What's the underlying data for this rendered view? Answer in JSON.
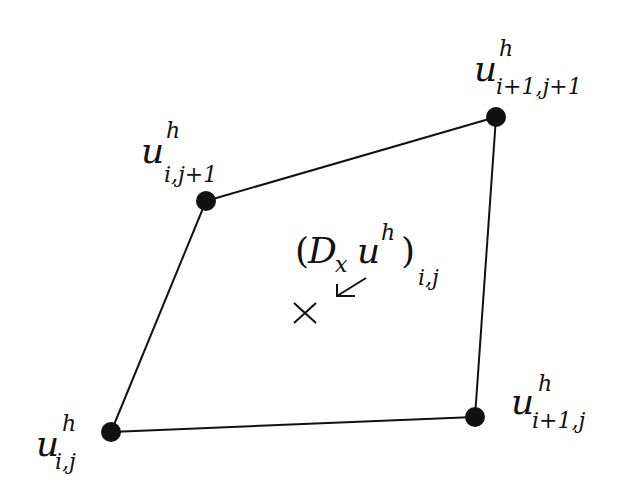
{
  "diagram": {
    "nodes": [
      {
        "id": "ij",
        "x": 111,
        "y": 432,
        "base": "u",
        "sup": "h",
        "sub": "i,j"
      },
      {
        "id": "i1j",
        "x": 475,
        "y": 417,
        "base": "u",
        "sup": "h",
        "sub": "i+1,j"
      },
      {
        "id": "i1j1",
        "x": 496,
        "y": 117,
        "base": "u",
        "sup": "h",
        "sub": "i+1,j+1"
      },
      {
        "id": "ij1",
        "x": 206,
        "y": 201,
        "base": "u",
        "sup": "h",
        "sub": "i,j+1"
      }
    ],
    "edges": [
      [
        "ij",
        "i1j"
      ],
      [
        "i1j",
        "i1j1"
      ],
      [
        "i1j1",
        "ij1"
      ],
      [
        "ij1",
        "ij"
      ]
    ],
    "operator": {
      "open": "(",
      "D": "D",
      "D_sub": "x",
      "u": "u",
      "u_sup": "h",
      "close": ")",
      "sub": "i,j",
      "marker": "×",
      "arrow": "↙"
    },
    "colors": {
      "ink": "#111111",
      "background": "#ffffff"
    }
  }
}
